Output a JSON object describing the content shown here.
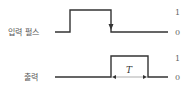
{
  "diagram": {
    "input": {
      "label": "입력 펄스",
      "level_high": "1",
      "level_low": "0"
    },
    "output": {
      "label": "출력",
      "level_high": "1",
      "level_low": "0",
      "duration_label": "T"
    },
    "colors": {
      "line": "#333333",
      "text": "#555555",
      "dimension": "#bbbbbb"
    }
  }
}
